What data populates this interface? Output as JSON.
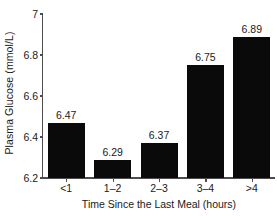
{
  "chart_data": {
    "type": "bar",
    "title": "",
    "subtitle": "",
    "xlabel": "Time Since the Last Meal (hours)",
    "ylabel": "Plasma Glucose (mmol/L)",
    "categories": [
      "<1",
      "1–2",
      "2–3",
      "3–4",
      ">4"
    ],
    "values": [
      6.47,
      6.29,
      6.37,
      6.75,
      6.89
    ],
    "value_labels": [
      "6.47",
      "6.29",
      "6.37",
      "6.75",
      "6.89"
    ],
    "ylim": [
      6.2,
      7.0
    ],
    "yticks": [
      6.2,
      6.4,
      6.6,
      6.8,
      7.0
    ],
    "ytick_labels": [
      "6.2",
      "6.4",
      "6.6",
      "6.8",
      "7"
    ],
    "grid": false,
    "legend": false,
    "legend_position": "none",
    "bar_color": "#0a0a0a",
    "axis_color": "#4d4d4d",
    "background_color": "#ffffff",
    "text_color": "#1a1a1a"
  }
}
